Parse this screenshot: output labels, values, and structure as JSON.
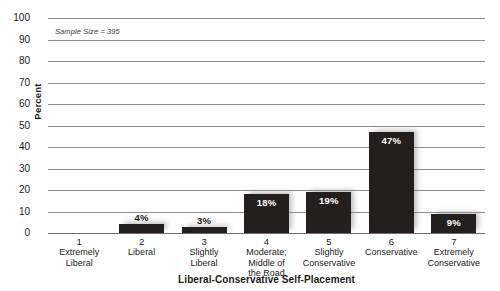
{
  "chart_data": {
    "type": "bar",
    "title": "",
    "xlabel": "Liberal-Conservative Self-Placement",
    "ylabel": "Percent",
    "ylim": [
      0,
      100
    ],
    "yticks": [
      100,
      90,
      80,
      70,
      60,
      50,
      40,
      30,
      20,
      10,
      0
    ],
    "grid": true,
    "legend": false,
    "annotation": "Sample Size = 395",
    "bar_color": "#231f1e",
    "categories": [
      "1 Extremely Liberal",
      "2 Liberal",
      "3 Slightly Liberal",
      "4 Moderate; Middle of the Road",
      "5 Slightly Conservative",
      "6 Conservative",
      "7 Extremely Conservative"
    ],
    "values": [
      0,
      4,
      3,
      18,
      19,
      47,
      9
    ],
    "bars": [
      {
        "num": "1",
        "lines": [
          "Extremely",
          "Liberal"
        ],
        "value": 0,
        "label": "",
        "label_pos": "none"
      },
      {
        "num": "2",
        "lines": [
          "Liberal"
        ],
        "value": 4,
        "label": "4%",
        "label_pos": "outside"
      },
      {
        "num": "3",
        "lines": [
          "Slightly",
          "Liberal"
        ],
        "value": 3,
        "label": "3%",
        "label_pos": "outside"
      },
      {
        "num": "4",
        "lines": [
          "Moderate;",
          "Middle of",
          "the Road"
        ],
        "value": 18,
        "label": "18%",
        "label_pos": "inside"
      },
      {
        "num": "5",
        "lines": [
          "Slightly",
          "Conservative"
        ],
        "value": 19,
        "label": "19%",
        "label_pos": "inside"
      },
      {
        "num": "6",
        "lines": [
          "Conservative"
        ],
        "value": 47,
        "label": "47%",
        "label_pos": "inside"
      },
      {
        "num": "7",
        "lines": [
          "Extremely",
          "Conservative"
        ],
        "value": 9,
        "label": "9%",
        "label_pos": "inside"
      }
    ]
  }
}
